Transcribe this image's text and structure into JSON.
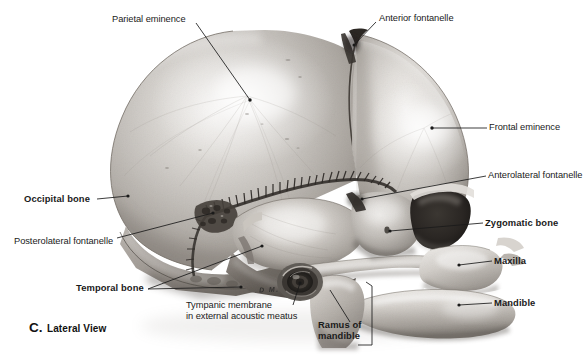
{
  "figure": {
    "domain": "anatomical-illustration",
    "view": "lateral",
    "background_color": "#ffffff",
    "ink_color": "#1a1a1a"
  },
  "caption": {
    "letter": "C.",
    "text": "Lateral View"
  },
  "signature": {
    "text": "D M."
  },
  "labels": [
    {
      "id": "parietal-eminence",
      "text": "Parietal eminence",
      "weight": "regular",
      "x": 112,
      "y": 14,
      "align": "left"
    },
    {
      "id": "anterior-fontanelle",
      "text": "Anterior fontanelle",
      "weight": "regular",
      "x": 379,
      "y": 13,
      "align": "left"
    },
    {
      "id": "frontal-eminence",
      "text": "Frontal eminence",
      "weight": "regular",
      "x": 489,
      "y": 122,
      "align": "left"
    },
    {
      "id": "anterolateral-fontanelle",
      "text": "Anterolateral fontanelle",
      "weight": "regular",
      "x": 488,
      "y": 170,
      "align": "left"
    },
    {
      "id": "zygomatic-bone",
      "text": "Zygomatic bone",
      "weight": "bold",
      "x": 485,
      "y": 217,
      "align": "left"
    },
    {
      "id": "maxilla",
      "text": "Maxilla",
      "weight": "bold",
      "x": 494,
      "y": 255,
      "align": "left"
    },
    {
      "id": "mandible",
      "text": "Mandible",
      "weight": "bold",
      "x": 494,
      "y": 297,
      "align": "left"
    },
    {
      "id": "occipital-bone",
      "text": "Occipital bone",
      "weight": "bold",
      "x": 24,
      "y": 193,
      "align": "left"
    },
    {
      "id": "posterolateral-fontanelle",
      "text": "Posterolateral fontanelle",
      "weight": "regular",
      "x": 14,
      "y": 236,
      "align": "left"
    },
    {
      "id": "temporal-bone",
      "text": "Temporal bone",
      "weight": "bold",
      "x": 76,
      "y": 282,
      "align": "left"
    },
    {
      "id": "tympanic-membrane",
      "text": "Tympanic membrane\nin external acoustic meatus",
      "line1": "Tympanic membrane",
      "line2": "in external acoustic meatus",
      "weight": "regular",
      "x": 186,
      "y": 300,
      "align": "left"
    },
    {
      "id": "ramus-of-mandible",
      "text": "Ramus of\nmandible",
      "line1": "Ramus of",
      "line2": "mandible",
      "weight": "bold",
      "x": 318,
      "y": 319,
      "align": "left"
    }
  ],
  "bone_regions": [
    {
      "id": "parietal-bone",
      "name": "Parietal bone"
    },
    {
      "id": "frontal-bone",
      "name": "Frontal bone"
    },
    {
      "id": "occipital-bone-region",
      "name": "Occipital bone"
    },
    {
      "id": "temporal-bone-region",
      "name": "Temporal bone"
    },
    {
      "id": "greater-wing-sphenoid",
      "name": "Greater wing of sphenoid"
    },
    {
      "id": "zygomatic-bone-region",
      "name": "Zygomatic bone"
    },
    {
      "id": "maxilla-region",
      "name": "Maxilla"
    },
    {
      "id": "mandible-region",
      "name": "Mandible"
    },
    {
      "id": "coronal-suture",
      "name": "Coronal suture"
    },
    {
      "id": "squamous-suture",
      "name": "Squamous suture"
    },
    {
      "id": "orbit",
      "name": "Orbit"
    },
    {
      "id": "external-acoustic-meatus",
      "name": "External acoustic meatus"
    }
  ]
}
